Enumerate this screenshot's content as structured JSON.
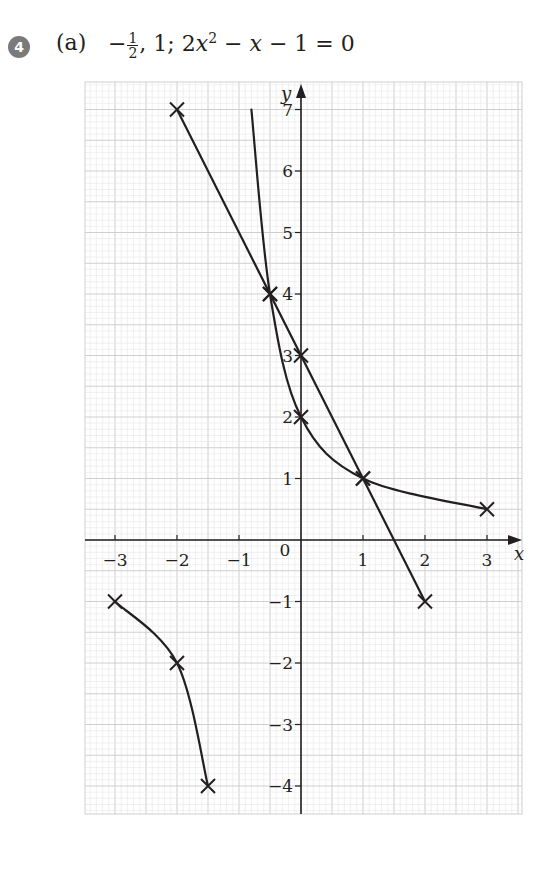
{
  "header": {
    "question_number": "4",
    "part_label": "(a)",
    "answer_prefix": "−",
    "fraction_num": "1",
    "fraction_den": "2",
    "answer_rest_1": ", 1; 2",
    "answer_var": "x",
    "answer_exp": "2",
    "answer_rest_2": " − ",
    "answer_var2": "x",
    "answer_rest_3": " − 1 = 0"
  },
  "chart_data": {
    "type": "line",
    "xlabel": "x",
    "ylabel": "y",
    "xlim": [
      -3.4,
      3.5
    ],
    "ylim": [
      -4.5,
      7.5
    ],
    "grid": true,
    "x_ticks": [
      -3,
      -2,
      -1,
      1,
      2,
      3
    ],
    "y_ticks": [
      -4,
      -3,
      -2,
      -1,
      1,
      2,
      3,
      4,
      5,
      6,
      7
    ],
    "origin_label": "0",
    "series": [
      {
        "name": "line y = 3 − 2x",
        "kind": "straight-line",
        "points": [
          [
            -2,
            7
          ],
          [
            -0.5,
            4
          ],
          [
            0,
            3
          ],
          [
            1,
            1
          ],
          [
            2,
            -1
          ]
        ],
        "marked_points": [
          [
            -2,
            7
          ],
          [
            -0.5,
            4
          ],
          [
            0,
            3
          ],
          [
            1,
            1
          ],
          [
            2,
            -1
          ]
        ]
      },
      {
        "name": "curve y = (x + 2)/(x + 1) branch right",
        "kind": "curve",
        "points": [
          [
            -0.8,
            7
          ],
          [
            -0.5,
            4
          ],
          [
            0,
            2
          ],
          [
            1,
            1
          ],
          [
            3,
            0.5
          ]
        ],
        "marked_points": [
          [
            -0.5,
            4
          ],
          [
            0,
            2
          ],
          [
            1,
            1
          ],
          [
            3,
            0.5
          ]
        ]
      },
      {
        "name": "curve branch left",
        "kind": "curve",
        "points": [
          [
            -3,
            -1
          ],
          [
            -2,
            -2
          ],
          [
            -1.5,
            -4
          ]
        ],
        "marked_points": [
          [
            -3,
            -1
          ],
          [
            -2,
            -2
          ],
          [
            -1.5,
            -4
          ]
        ]
      }
    ],
    "intersections": [
      [
        -0.5,
        4
      ],
      [
        1,
        1
      ]
    ]
  },
  "colors": {
    "ink": "#231f20",
    "grid_minor": "#e6e6e6",
    "grid_major": "#cfcfcf",
    "badge": "#7a7a7a"
  }
}
